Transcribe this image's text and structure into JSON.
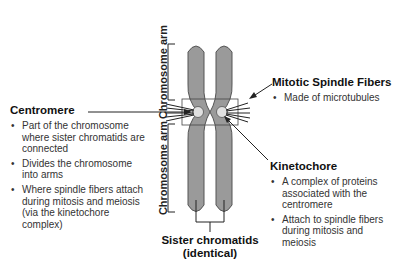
{
  "diagram": {
    "subject": "chromosome",
    "colors": {
      "chromatid_fill": "#9a9a9a",
      "chromatid_stroke": "#555555",
      "centromere_fill": "#d8d8d8",
      "line": "#222222"
    }
  },
  "labels": {
    "chromosome_arm_top": "Chromosome arm",
    "chromosome_arm_bottom": "Chromosome arm",
    "sister_chromatids_line1": "Sister chromatids",
    "sister_chromatids_line2": "(identical)"
  },
  "centromere": {
    "title": "Centromere",
    "bullets": [
      "Part of the chromosome where sister chromatids are connected",
      "Divides the chromosome into arms",
      "Where spindle fibers attach during mitosis and meiosis (via the kinetochore complex)"
    ]
  },
  "spindle_fibers": {
    "title": "Mitotic Spindle Fibers",
    "bullets": [
      "Made of microtubules"
    ]
  },
  "kinetochore": {
    "title": "Kinetochore",
    "bullets": [
      "A complex of proteins associated with the centromere",
      "Attach to spindle fibers during mitosis and meiosis"
    ]
  }
}
